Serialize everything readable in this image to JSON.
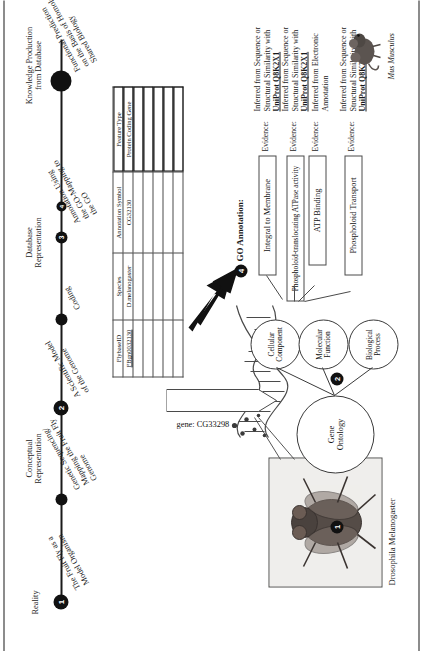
{
  "timeline": {
    "phases": [
      {
        "label": "Reality"
      },
      {
        "label": "Conceptual\nRepresentation"
      },
      {
        "label": "Database\nRepresentation"
      },
      {
        "label": "Knowledge Production\nfrom Database"
      }
    ],
    "events": [
      {
        "label": "The Fruit Fly as a\nModel Organism"
      },
      {
        "label": "Genetic Sequencing/\nMapping the Fruit Fly\nGenome"
      },
      {
        "label": "A Scientific Model\nof the Genome"
      },
      {
        "label": "Coding"
      },
      {
        "label": "Annotation Using\nthe GO-Mapping to\nthe GO"
      },
      {
        "label": "Functional Prediction\non the Basis of Homology/\nShared Biology"
      }
    ]
  },
  "stages": [
    {
      "number": "1",
      "label": ""
    },
    {
      "number": "2",
      "label": ""
    },
    {
      "number": "3",
      "label": "FlyBase"
    },
    {
      "number": "4",
      "label": "GO Annotation:"
    }
  ],
  "organism": {
    "caption": "Drosophila Melanogaster",
    "photo_alt": "fruit-fly-photograph"
  },
  "gene_callout": {
    "label": "gene: CG33298"
  },
  "table": {
    "headers": [
      "FlybaseID",
      "Species",
      "Annotation Symbol",
      "Feature Type"
    ],
    "rows": [
      [
        "FBgn0032130",
        "D.melanogaster",
        "CG32130",
        "Protein Coding Gene"
      ]
    ],
    "highlighted_column_index": 3
  },
  "go_annotations": [
    {
      "term": "Integral to Membrane",
      "branch": "Cellular Component",
      "evidence_label": "Evidence:",
      "evidence_prefix": "Inferred from Sequence or Structural",
      "evidence_mid": "Similarity with ",
      "evidence_db": "UniProt Q8K2X1",
      "evidence_bold": true
    },
    {
      "term": "Phospholoid-translocating ATPase activity",
      "branch": "Molecular Function",
      "evidence_label": "Evidence:",
      "evidence_prefix": "Inferred from Sequence or Structural",
      "evidence_mid": "Similarity with ",
      "evidence_db": "UniProt Q8K2X1",
      "evidence_bold": true
    },
    {
      "term": "ATP Binding",
      "branch": "Molecular Function",
      "evidence_label": "Evidence:",
      "evidence_prefix": "Inferred from Electronic Annotation",
      "evidence_mid": "",
      "evidence_db": "",
      "evidence_bold": false
    },
    {
      "term": "Phospholoid Transport",
      "branch": "Biological Process",
      "evidence_label": "Evidence:",
      "evidence_prefix": "Inferred from Sequence or Structural",
      "evidence_mid": "Similarity with ",
      "evidence_db": "UniProt Q8K2X1",
      "evidence_bold": true
    }
  ],
  "ontology": {
    "root": "Gene\nOntology",
    "branches": [
      {
        "label": "Cellular\nComponent"
      },
      {
        "label": "Molecular\nFunction"
      },
      {
        "label": "Biological\nProcess"
      }
    ]
  },
  "reference_organism": {
    "caption": "Mus Musculus",
    "photo_alt": "mouse-illustration"
  },
  "colors": {
    "ink": "#1a1a1a",
    "line": "#3a3a3a",
    "badge_fill": "#111111",
    "badge_text": "#ffffff",
    "paper": "#ffffff"
  }
}
